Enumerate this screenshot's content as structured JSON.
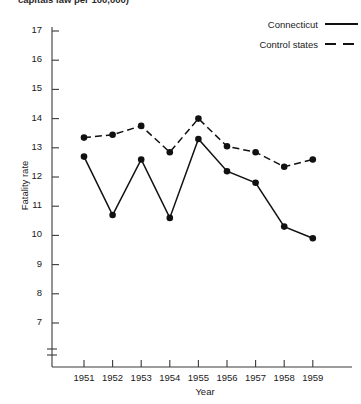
{
  "figure": {
    "title_clipped": "capitals law per 100,000)",
    "axis_title_y": "Fatality rate",
    "axis_title_x": "Year"
  },
  "legend": {
    "position": "top-right",
    "entries": [
      {
        "label": "Connecticut",
        "style": "solid",
        "color": "#111111"
      },
      {
        "label": "Control states",
        "style": "dashed",
        "color": "#111111"
      }
    ]
  },
  "chart_data": {
    "type": "line",
    "title": "capitals law per 100,000)",
    "xlabel": "Year",
    "ylabel": "Fatality rate",
    "categories": [
      "1951",
      "1952",
      "1953",
      "1954",
      "1955",
      "1956",
      "1957",
      "1958",
      "1959"
    ],
    "x": [
      1951,
      1952,
      1953,
      1954,
      1955,
      1956,
      1957,
      1958,
      1959
    ],
    "xlim": [
      1950.5,
      1959.5
    ],
    "ylim": [
      6.6,
      17.3
    ],
    "yticks": [
      7,
      8,
      9,
      10,
      11,
      12,
      13,
      14,
      15,
      16,
      17
    ],
    "y_axis_break": true,
    "grid": false,
    "markers": "filled-circle",
    "series": [
      {
        "name": "Connecticut",
        "style": "solid",
        "color": "#111111",
        "values": [
          12.7,
          10.7,
          12.6,
          10.6,
          13.3,
          12.2,
          11.8,
          10.3,
          9.9
        ]
      },
      {
        "name": "Control states",
        "style": "dashed",
        "color": "#111111",
        "values": [
          13.35,
          13.45,
          13.75,
          12.85,
          14.0,
          13.05,
          12.85,
          12.35,
          12.6
        ]
      }
    ]
  }
}
